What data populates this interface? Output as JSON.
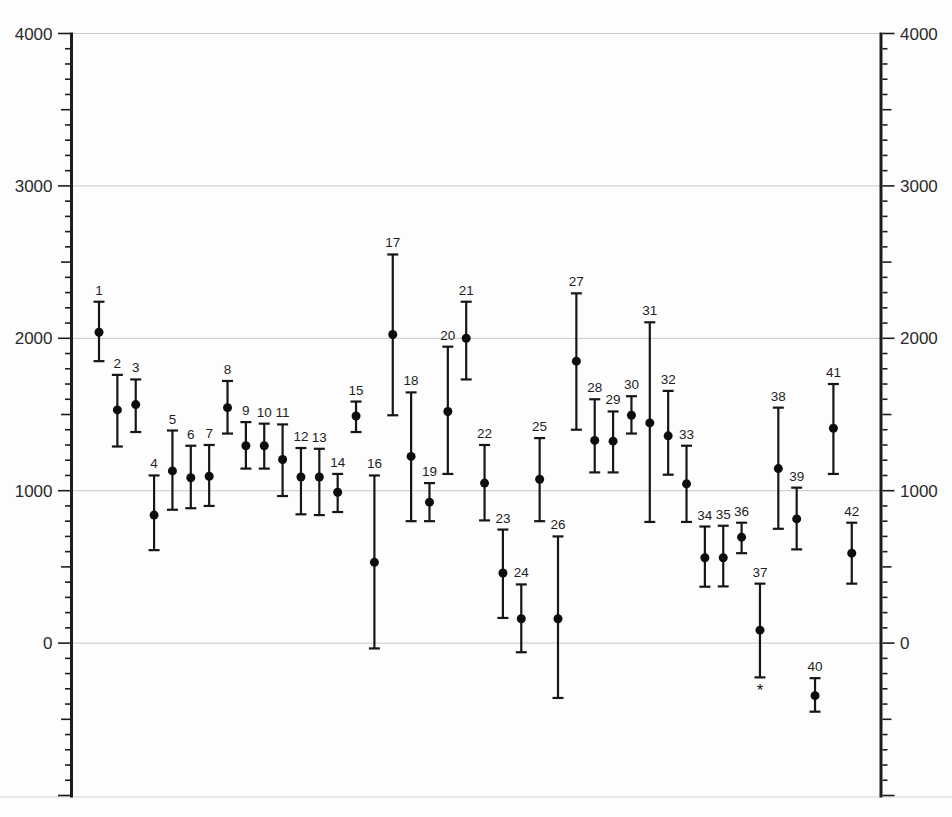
{
  "page": {
    "background_color": "#fdfdfd",
    "title": ""
  },
  "chart_data": {
    "type": "scatter",
    "subtype": "errorbar",
    "title": "",
    "xlabel": "",
    "ylabel": "",
    "legend": "none",
    "x_axis": {
      "tick_labels_visible": false
    },
    "y_axis": {
      "min": -1000,
      "max": 4000,
      "minor_step": 100,
      "medium_step": 500,
      "major_step": 1000,
      "sides": [
        "left",
        "right"
      ],
      "tick_labels": [
        "0",
        "1000",
        "2000",
        "3000",
        "4000"
      ],
      "tick_label_values": [
        0,
        1000,
        2000,
        3000,
        4000
      ],
      "grid_values": [
        0,
        1000,
        2000,
        3000,
        4000
      ],
      "grid_on": true
    },
    "series": [
      {
        "name": "numbered-estimates-with-error-bars",
        "points": [
          {
            "label": "1",
            "value": 2040,
            "lo": 1850,
            "hi": 2240
          },
          {
            "label": "2",
            "value": 1530,
            "lo": 1290,
            "hi": 1760
          },
          {
            "label": "3",
            "value": 1565,
            "lo": 1385,
            "hi": 1730
          },
          {
            "label": "4",
            "value": 840,
            "lo": 610,
            "hi": 1100
          },
          {
            "label": "5",
            "value": 1130,
            "lo": 875,
            "hi": 1395
          },
          {
            "label": "6",
            "value": 1085,
            "lo": 885,
            "hi": 1295
          },
          {
            "label": "7",
            "value": 1095,
            "lo": 900,
            "hi": 1300
          },
          {
            "label": "8",
            "value": 1545,
            "lo": 1375,
            "hi": 1720
          },
          {
            "label": "9",
            "value": 1295,
            "lo": 1145,
            "hi": 1450
          },
          {
            "label": "10",
            "value": 1295,
            "lo": 1145,
            "hi": 1440
          },
          {
            "label": "11",
            "value": 1205,
            "lo": 965,
            "hi": 1435
          },
          {
            "label": "12",
            "value": 1090,
            "lo": 845,
            "hi": 1280
          },
          {
            "label": "13",
            "value": 1090,
            "lo": 840,
            "hi": 1275
          },
          {
            "label": "14",
            "value": 990,
            "lo": 860,
            "hi": 1110
          },
          {
            "label": "15",
            "value": 1490,
            "lo": 1385,
            "hi": 1585
          },
          {
            "label": "16",
            "value": 530,
            "lo": -35,
            "hi": 1100
          },
          {
            "label": "17",
            "value": 2025,
            "lo": 1495,
            "hi": 2550
          },
          {
            "label": "18",
            "value": 1225,
            "lo": 800,
            "hi": 1645
          },
          {
            "label": "19",
            "value": 925,
            "lo": 800,
            "hi": 1050
          },
          {
            "label": "20",
            "value": 1520,
            "lo": 1110,
            "hi": 1945
          },
          {
            "label": "21",
            "value": 2000,
            "lo": 1730,
            "hi": 2240
          },
          {
            "label": "22",
            "value": 1050,
            "lo": 805,
            "hi": 1300
          },
          {
            "label": "23",
            "value": 460,
            "lo": 165,
            "hi": 745
          },
          {
            "label": "24",
            "value": 160,
            "lo": -60,
            "hi": 385
          },
          {
            "label": "25",
            "value": 1075,
            "lo": 800,
            "hi": 1345
          },
          {
            "label": "26",
            "value": 160,
            "lo": -360,
            "hi": 700
          },
          {
            "label": "27",
            "value": 1850,
            "lo": 1400,
            "hi": 2295
          },
          {
            "label": "28",
            "value": 1330,
            "lo": 1120,
            "hi": 1600
          },
          {
            "label": "29",
            "value": 1325,
            "lo": 1120,
            "hi": 1520
          },
          {
            "label": "30",
            "value": 1495,
            "lo": 1375,
            "hi": 1620
          },
          {
            "label": "31",
            "value": 1445,
            "lo": 795,
            "hi": 2105
          },
          {
            "label": "32",
            "value": 1360,
            "lo": 1105,
            "hi": 1655
          },
          {
            "label": "33",
            "value": 1045,
            "lo": 795,
            "hi": 1295
          },
          {
            "label": "34",
            "value": 560,
            "lo": 370,
            "hi": 765
          },
          {
            "label": "35",
            "value": 560,
            "lo": 372,
            "hi": 770
          },
          {
            "label": "36",
            "value": 695,
            "lo": 590,
            "hi": 790
          },
          {
            "label": "37",
            "value": 85,
            "lo": -225,
            "hi": 390
          },
          {
            "label": "38",
            "value": 1145,
            "lo": 750,
            "hi": 1545
          },
          {
            "label": "39",
            "value": 815,
            "lo": 615,
            "hi": 1020
          },
          {
            "label": "40",
            "value": -345,
            "lo": -450,
            "hi": -230
          },
          {
            "label": "41",
            "value": 1410,
            "lo": 1110,
            "hi": 1700
          },
          {
            "label": "42",
            "value": 590,
            "lo": 390,
            "hi": 790
          }
        ]
      }
    ],
    "annotations": [
      {
        "text": "*",
        "attached_to": "37",
        "position": "below-lower-cap"
      }
    ],
    "colors": {
      "point": "#0d0d0d",
      "error_bar": "#161616",
      "grid": "#c9c9c9",
      "spine": "#1c1c1c",
      "label": "#2a2a2a"
    }
  }
}
